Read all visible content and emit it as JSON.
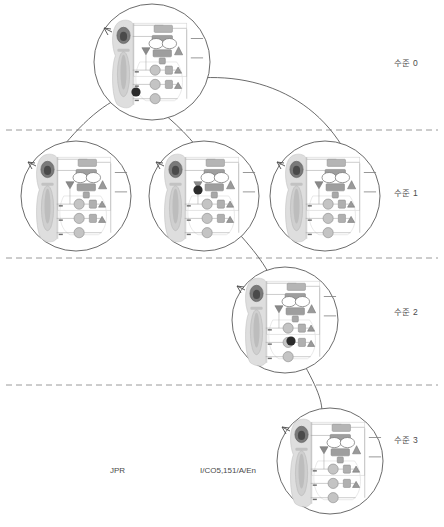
{
  "figure": {
    "type": "hierarchy-decomposition-diagram",
    "background": "#ffffff",
    "line_color": "#5a5a5a",
    "dash_color": "#9a9a9a",
    "node_marker_color": "#2b2b2b"
  },
  "levels": [
    {
      "id": "level-0",
      "label": "수준 0",
      "label_x": 394,
      "label_y": 56,
      "divider_y": 130
    },
    {
      "id": "level-1",
      "label": "수준 1",
      "label_x": 394,
      "label_y": 186,
      "divider_y": 258
    },
    {
      "id": "level-2",
      "label": "수준 2",
      "label_x": 394,
      "label_y": 305,
      "divider_y": 385
    },
    {
      "id": "level-3",
      "label": "수준 3",
      "label_x": 394,
      "label_y": 433,
      "divider_y": null
    }
  ],
  "nodes": [
    {
      "id": "n0",
      "level": 0,
      "cx": 152,
      "cy": 62,
      "r": 58,
      "marker_x": 136,
      "marker_y": 92
    },
    {
      "id": "n1a",
      "level": 1,
      "cx": 76,
      "cy": 196,
      "r": 55,
      "marker_x": null,
      "marker_y": null
    },
    {
      "id": "n1b",
      "level": 1,
      "cx": 204,
      "cy": 196,
      "r": 55,
      "marker_x": 198,
      "marker_y": 190
    },
    {
      "id": "n1c",
      "level": 1,
      "cx": 325,
      "cy": 196,
      "r": 55,
      "marker_x": null,
      "marker_y": null
    },
    {
      "id": "n2",
      "level": 2,
      "cx": 285,
      "cy": 320,
      "r": 53,
      "marker_x": 291,
      "marker_y": 341
    },
    {
      "id": "n3",
      "level": 3,
      "cx": 330,
      "cy": 461,
      "r": 53,
      "marker_x": null,
      "marker_y": null
    }
  ],
  "connectors": [
    {
      "id": "c-n0-n1a",
      "from": "n0",
      "to": "n1a",
      "path": "M136,92 C110,98 86,118 60,150"
    },
    {
      "id": "c-n0-n1b",
      "from": "n0",
      "to": "n1b",
      "path": "M136,92 C160,110 180,126 196,146"
    },
    {
      "id": "c-n0-n1c",
      "from": "n0",
      "to": "n1c",
      "path": "M136,92 C215,62 300,78 342,146"
    },
    {
      "id": "c-n1b-n2",
      "from": "n1b",
      "to": "n2",
      "path": "M198,190 C232,226 256,250 268,272"
    },
    {
      "id": "c-n2-n3",
      "from": "n2",
      "to": "n3",
      "path": "M291,341 C312,378 322,396 322,412"
    }
  ],
  "footer_labels": [
    {
      "id": "label-jpr",
      "text": "JPR",
      "x": 110,
      "y": 466
    },
    {
      "id": "label-code",
      "text": "I/CO5,151/A/En",
      "x": 200,
      "y": 466
    }
  ],
  "thumbnail": {
    "description": "miniature process flow diagram repeated inside every circular node",
    "swimlane_fill": "#dcdcdc",
    "shape_fill": "#c8c8c8",
    "accent_dark": "#6e6e6e",
    "box_fill": "#b9b9b9"
  }
}
